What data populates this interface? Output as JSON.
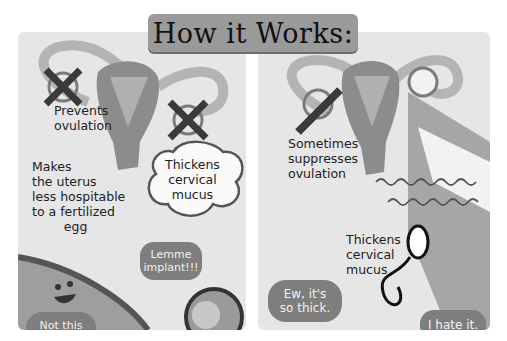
{
  "title": "How it Works:",
  "left_panel": {
    "label_ovulation": "Prevents\novulation",
    "label_uterus": "Makes\nthe uterus\nless hospitable\nto a fertilized\n        egg",
    "thought_mucus": "Thickens\ncervical\nmucus",
    "bubble_egg": "Lemme\nimplant!!!",
    "bubble_uterus": "Not this\ntime, buddy!"
  },
  "right_panel": {
    "label_ovulation": "Sometimes\nsuppresses\novulation",
    "label_mucus": "Thickens\ncervical\nmucus",
    "bubble_sperm": "Ew, it's\nso thick.",
    "bubble_other": "I hate it."
  }
}
